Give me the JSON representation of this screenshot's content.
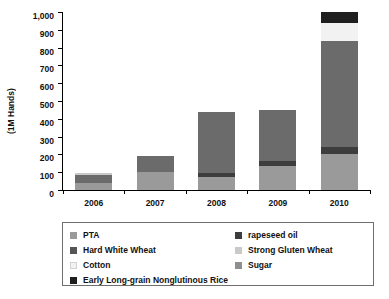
{
  "chart_data": {
    "type": "bar",
    "subtype": "stacked-bar",
    "title": "",
    "xlabel": "",
    "ylabel": "(1M Hands)",
    "ylim": [
      0,
      1000
    ],
    "ytick_labels": [
      "1,000",
      "900",
      "800",
      "700",
      "600",
      "500",
      "400",
      "300",
      "200",
      "100",
      "0"
    ],
    "ytick_values": [
      1000,
      900,
      800,
      700,
      600,
      500,
      400,
      300,
      200,
      100,
      0
    ],
    "grid": false,
    "legend_position": "bottom",
    "categories": [
      "2006",
      "2007",
      "2008",
      "2009",
      "2010"
    ],
    "series": [
      {
        "name": "PTA",
        "color": "#9a9a9a",
        "values": [
          40,
          100,
          75,
          135,
          200
        ]
      },
      {
        "name": "rapeseed oil",
        "color": "#3d3d3d",
        "values": [
          0,
          0,
          20,
          30,
          40
        ]
      },
      {
        "name": "Hard White Wheat",
        "color": "#6b6b6b",
        "values": [
          45,
          90,
          345,
          285,
          595
        ]
      },
      {
        "name": "Strong Gluten Wheat",
        "color": "#c9c9c9",
        "values": [
          10,
          0,
          0,
          0,
          0
        ]
      },
      {
        "name": "Cotton",
        "color": "#f2f2f2",
        "values": [
          0,
          0,
          0,
          0,
          105
        ]
      },
      {
        "name": "Sugar",
        "color": "#8f8f8f",
        "values": [
          0,
          0,
          0,
          0,
          0
        ]
      },
      {
        "name": "Early Long-grain Nonglutinous Rice",
        "color": "#1f1f1f",
        "values": [
          0,
          0,
          0,
          0,
          60
        ]
      }
    ],
    "totals": [
      95,
      190,
      440,
      450,
      1000
    ]
  },
  "axis": {
    "y_title": "(1M Hands)"
  },
  "legend": {
    "left_column": [
      {
        "label": "PTA",
        "color": "#9a9a9a"
      },
      {
        "label": "Hard White Wheat",
        "color": "#555555"
      },
      {
        "label": "Cotton",
        "color": "#f2f2f2"
      },
      {
        "label": "Early Long-grain Nonglutinous Rice",
        "color": "#1f1f1f"
      }
    ],
    "right_column": [
      {
        "label": "rapeseed oil",
        "color": "#3d3d3d"
      },
      {
        "label": "Strong Gluten Wheat",
        "color": "#c9c9c9"
      },
      {
        "label": "Sugar",
        "color": "#8f8f8f"
      }
    ]
  }
}
